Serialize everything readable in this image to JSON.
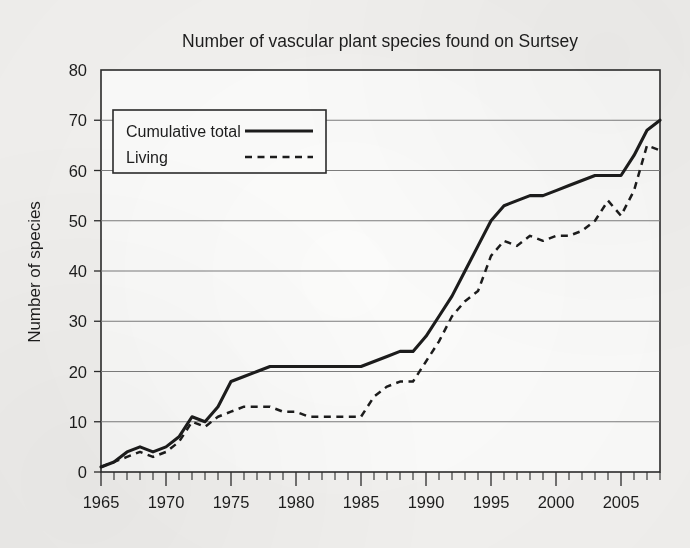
{
  "chart_data": {
    "type": "line",
    "title": "Number of vascular plant species found on Surtsey",
    "xlabel": "",
    "ylabel": "Number of species",
    "xlim": [
      1965,
      2008
    ],
    "ylim": [
      0,
      80
    ],
    "ytick_step": 10,
    "yticks": [
      0,
      10,
      20,
      30,
      40,
      50,
      60,
      70,
      80
    ],
    "ytick_labels": [
      "0",
      "10",
      "20",
      "30",
      "40",
      "50",
      "60",
      "70",
      "80"
    ],
    "xticks_major": [
      1965,
      1970,
      1975,
      1980,
      1985,
      1990,
      1995,
      2000,
      2005
    ],
    "xtick_labels": [
      "1965",
      "1970",
      "1975",
      "1980",
      "1985",
      "1990",
      "1995",
      "2000",
      "2005"
    ],
    "xtick_minor_step": 1,
    "grid": "horizontal",
    "legend_position": "upper-left-inside",
    "x": [
      1965,
      1966,
      1967,
      1968,
      1969,
      1970,
      1971,
      1972,
      1973,
      1974,
      1975,
      1976,
      1977,
      1978,
      1979,
      1980,
      1981,
      1982,
      1983,
      1984,
      1985,
      1986,
      1987,
      1988,
      1989,
      1990,
      1991,
      1992,
      1993,
      1994,
      1995,
      1996,
      1997,
      1998,
      1999,
      2000,
      2001,
      2002,
      2003,
      2004,
      2005,
      2006,
      2007,
      2008
    ],
    "series": [
      {
        "name": "Cumulative total",
        "style": "solid",
        "color": "#1c1c1c",
        "values": [
          1,
          2,
          4,
          5,
          4,
          5,
          7,
          11,
          10,
          13,
          18,
          19,
          20,
          21,
          21,
          21,
          21,
          21,
          21,
          21,
          21,
          22,
          23,
          24,
          24,
          27,
          31,
          35,
          40,
          45,
          50,
          53,
          54,
          55,
          55,
          56,
          57,
          58,
          59,
          59,
          59,
          63,
          68,
          70
        ]
      },
      {
        "name": "Living",
        "style": "dashed",
        "color": "#1c1c1c",
        "values": [
          1,
          2,
          3,
          4,
          3,
          4,
          6,
          10,
          9,
          11,
          12,
          13,
          13,
          13,
          12,
          12,
          11,
          11,
          11,
          11,
          11,
          15,
          17,
          18,
          18,
          22,
          26,
          31,
          34,
          36,
          43,
          46,
          45,
          47,
          46,
          47,
          47,
          48,
          50,
          54,
          51,
          56,
          65,
          64
        ]
      }
    ]
  },
  "legend": {
    "items": [
      {
        "label": "Cumulative total",
        "style": "solid"
      },
      {
        "label": "Living",
        "style": "dashed"
      }
    ]
  }
}
